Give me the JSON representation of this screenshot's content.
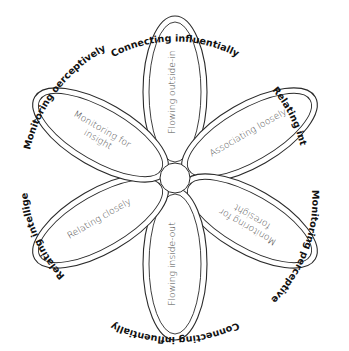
{
  "diagram": {
    "type": "six-petal flower",
    "center": {
      "label": ""
    },
    "petals": [
      {
        "label": "Flowing outside-in",
        "lines": [
          "Flowing outside-in"
        ],
        "position": "top",
        "angle": 0
      },
      {
        "label": "Associating loosely",
        "lines": [
          "Associating loosely"
        ],
        "position": "upper-right",
        "angle": 60
      },
      {
        "label": "Monitoring for foresight",
        "lines": [
          "Monitoring for",
          "foresight"
        ],
        "position": "lower-right",
        "angle": 120
      },
      {
        "label": "Flowing inside-out",
        "lines": [
          "Flowing inside-out"
        ],
        "position": "bottom",
        "angle": 180
      },
      {
        "label": "Relating closely",
        "lines": [
          "Relating closely"
        ],
        "position": "lower-left",
        "angle": 240
      },
      {
        "label": "Monitoring for insight",
        "lines": [
          "Monitoring for",
          "insight"
        ],
        "position": "upper-left",
        "angle": 300
      }
    ],
    "ring_labels": [
      {
        "label": "Connecting influentially",
        "position": "top"
      },
      {
        "label": "Relating intelligently",
        "position": "upper-right"
      },
      {
        "label": "Monitoring perceptively",
        "position": "lower-right"
      },
      {
        "label": "Connecting influentially",
        "position": "bottom"
      },
      {
        "label": "Relating intelligently",
        "position": "lower-left"
      },
      {
        "label": "Monitoring oerceptively",
        "position": "upper-left"
      }
    ]
  }
}
